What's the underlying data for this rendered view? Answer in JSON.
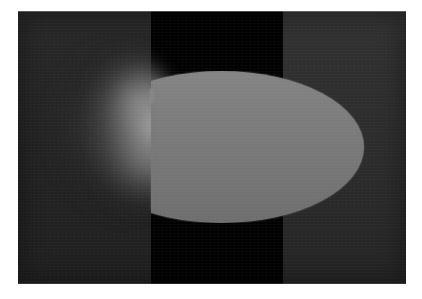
{
  "figure": {
    "kind": "grayscale-flow-visualization",
    "title": "",
    "caption": "",
    "frame": {
      "left_px": 18,
      "top_px": 11,
      "width_px": 388,
      "height_px": 273,
      "page_background": "#ffffff"
    }
  },
  "palette": {
    "page_background": "#ffffff",
    "field_left": "#242424",
    "field_right": "#2c2c2c",
    "dark_band": "#010101",
    "body_fill": "#787878",
    "body_fill_top": "#848484",
    "body_fill_bottom": "#6e6e6e",
    "plume_bright": "#5a5a5a",
    "plume_peak": "#8f8f8f"
  },
  "regions": {
    "left_field": {
      "label": "left dark field",
      "x_px": 0,
      "width_px": 133,
      "mean_gray": "#242424"
    },
    "dark_band": {
      "label": "central black band",
      "x_px": 133,
      "width_px": 132,
      "mean_gray": "#010101"
    },
    "right_field": {
      "label": "right dark field",
      "x_px": 265,
      "width_px": 123,
      "mean_gray": "#2c2c2c"
    }
  },
  "objects": {
    "body": {
      "label": "bright ellipsoidal body",
      "shape": "ellipse-clipped-left",
      "center_x_px": 204,
      "center_y_px": 136,
      "semi_major_px": 142,
      "semi_minor_px": 76,
      "left_cut_x_px": 133,
      "right_tip_x_px": 348,
      "top_y_px": 60,
      "bottom_y_px": 212,
      "fill": "#787878"
    },
    "plume": {
      "label": "bow-shock glow plume",
      "shape": "crescent",
      "leading_x_px": 16,
      "trailing_x_px": 150,
      "top_y_px": 32,
      "bottom_y_px": 212,
      "peak_gray": "#8f8f8f",
      "falloff": "radial-soft"
    }
  },
  "chart_data": {
    "type": "heatmap",
    "title": "",
    "xlabel": "",
    "ylabel": "",
    "colormap": "grayscale",
    "value_range": [
      0,
      255
    ],
    "grid": false,
    "legend": false,
    "annotations": []
  }
}
